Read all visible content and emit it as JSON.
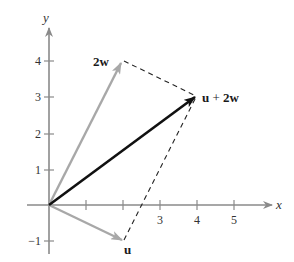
{
  "figure": {
    "type": "vector-addition-diagram",
    "axes": {
      "x_label": "x",
      "y_label": "y",
      "x_ticks": [
        {
          "value": 1,
          "label": ""
        },
        {
          "value": 2,
          "label": ""
        },
        {
          "value": 3,
          "label": "3"
        },
        {
          "value": 4,
          "label": "4"
        },
        {
          "value": 5,
          "label": "5"
        }
      ],
      "y_ticks": [
        {
          "value": -1,
          "label": "−1"
        },
        {
          "value": 1,
          "label": "1"
        },
        {
          "value": 2,
          "label": "2"
        },
        {
          "value": 3,
          "label": "3"
        },
        {
          "value": 4,
          "label": "4"
        }
      ],
      "x_range": [
        -0.7,
        6.1
      ],
      "y_range": [
        -1.4,
        5.4
      ]
    },
    "vectors": [
      {
        "name": "u",
        "label": "u",
        "from": [
          0,
          0
        ],
        "to": [
          2,
          -1
        ],
        "color": "#a8a8a8",
        "style": "solid"
      },
      {
        "name": "2w",
        "label": "2w",
        "from": [
          0,
          0
        ],
        "to": [
          2,
          4
        ],
        "color": "#a8a8a8",
        "style": "solid"
      },
      {
        "name": "u+2w",
        "label_bold_1": "u",
        "label_plus": " + ",
        "label_bold_2": "2w",
        "from": [
          0,
          0
        ],
        "to": [
          4,
          3
        ],
        "color": "#111111",
        "style": "solid"
      }
    ],
    "parallelogram_edges": [
      {
        "from": [
          2,
          4
        ],
        "to": [
          4,
          3
        ],
        "style": "dashed",
        "color": "#222222"
      },
      {
        "from": [
          2,
          -1
        ],
        "to": [
          4,
          3
        ],
        "style": "dashed",
        "color": "#222222"
      }
    ],
    "colors": {
      "axis": "#8a8a8a",
      "light_vector": "#a8a8a8",
      "result_vector": "#111111",
      "dashed": "#222222",
      "background": "#ffffff"
    }
  }
}
